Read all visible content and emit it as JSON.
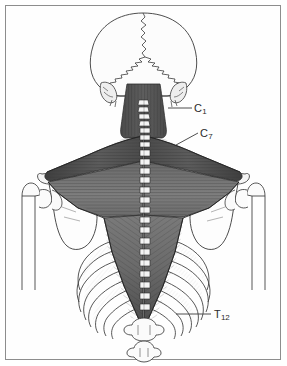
{
  "figure": {
    "background_color": "#ffffff",
    "frame_color": "#8d8d8d",
    "muscle_color_dark": "#4a4a4a",
    "muscle_color_mid": "#6f6f6f",
    "muscle_color_light": "#9a9a9a",
    "bone_outline_color": "#3a3a3a",
    "bone_fill_color": "#fbfbfb",
    "bone_shadow_color": "#d8d8d8"
  },
  "labels": [
    {
      "id": "c1",
      "name": "vertebra-label-c1",
      "letter": "C",
      "subscript": "1",
      "full_text": "C1",
      "description": "First cervical vertebra (atlas)",
      "leader_from_x": 168,
      "leader_from_y": 108,
      "leader_to_x": 192,
      "leader_to_y": 108
    },
    {
      "id": "c7",
      "name": "vertebra-label-c7",
      "letter": "C",
      "subscript": "7",
      "full_text": "C7",
      "description": "Seventh cervical vertebra",
      "leader_from_x": 176,
      "leader_from_y": 145,
      "leader_to_x": 198,
      "leader_to_y": 133
    },
    {
      "id": "t12",
      "name": "vertebra-label-t12",
      "letter": "T",
      "subscript": "12",
      "full_text": "T12",
      "description": "Twelfth thoracic vertebra",
      "leader_from_x": 176,
      "leader_from_y": 314,
      "leader_to_x": 211,
      "leader_to_y": 314
    }
  ],
  "structures": [
    {
      "id": "skull",
      "name": "skull-occipital",
      "label": "Skull (occipital view)"
    },
    {
      "id": "trapezius",
      "name": "trapezius-muscle",
      "label": "Trapezius muscle"
    },
    {
      "id": "spine",
      "name": "vertebral-column",
      "label": "Vertebral column spinous processes"
    },
    {
      "id": "scapula-left",
      "name": "scapula-left",
      "label": "Left scapula"
    },
    {
      "id": "scapula-right",
      "name": "scapula-right",
      "label": "Right scapula"
    },
    {
      "id": "humerus-left",
      "name": "humerus-left",
      "label": "Left humerus"
    },
    {
      "id": "humerus-right",
      "name": "humerus-right",
      "label": "Right humerus"
    },
    {
      "id": "ribcage",
      "name": "rib-cage",
      "label": "Rib cage"
    }
  ]
}
